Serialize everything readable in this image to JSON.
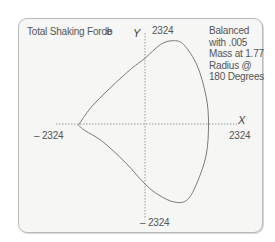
{
  "chart_data": {
    "type": "line",
    "subtype": "polar-force-locus",
    "title": "Total Shaking Force",
    "unit": "lb",
    "xlabel": "X",
    "ylabel": "Y",
    "xlim": [
      -2324,
      2324
    ],
    "ylim": [
      -2324,
      2324
    ],
    "tick_labels": {
      "x_min": "– 2324",
      "x_max": "2324",
      "y_min": "– 2324",
      "y_max": "2324"
    },
    "annotation": "Balanced with .005 Mass at 1.77 Radius @ 180 Degrees",
    "grid": false,
    "axes_style": "dotted",
    "series": [
      {
        "name": "Shaking force locus",
        "points": [
          {
            "x": -1720,
            "y": -30
          },
          {
            "x": -1400,
            "y": 420
          },
          {
            "x": -900,
            "y": 930
          },
          {
            "x": -350,
            "y": 1430
          },
          {
            "x": 0,
            "y": 1700
          },
          {
            "x": 400,
            "y": 2050
          },
          {
            "x": 720,
            "y": 2150
          },
          {
            "x": 1000,
            "y": 2050
          },
          {
            "x": 1350,
            "y": 1500
          },
          {
            "x": 1580,
            "y": 700
          },
          {
            "x": 1640,
            "y": 0
          },
          {
            "x": 1580,
            "y": -800
          },
          {
            "x": 1350,
            "y": -1500
          },
          {
            "x": 1100,
            "y": -1950
          },
          {
            "x": 770,
            "y": -2020
          },
          {
            "x": 350,
            "y": -1830
          },
          {
            "x": 0,
            "y": -1550
          },
          {
            "x": -500,
            "y": -1000
          },
          {
            "x": -1100,
            "y": -450
          },
          {
            "x": -1550,
            "y": -170
          },
          {
            "x": -1720,
            "y": -30
          }
        ]
      }
    ]
  },
  "labels": {
    "title": "Total Shaking Force",
    "unit": "lb",
    "y_axis": "Y",
    "x_axis": "X",
    "y_max": "2324",
    "y_min": "– 2324",
    "x_min": "– 2324",
    "x_max": "2324",
    "note": "Balanced with .005 Mass at 1.77 Radius @ 180 Degrees"
  },
  "colors": {
    "curve": "#7a7a7a",
    "axes": "#9a9a9a",
    "frame": "#b9b9b9",
    "background": "#f6f6f4"
  }
}
